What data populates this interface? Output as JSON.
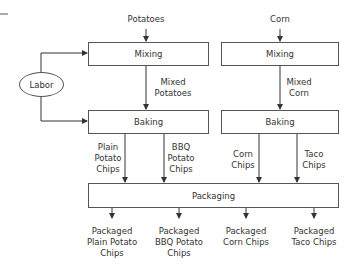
{
  "diagram": {
    "inputs": {
      "potatoes": "Potatoes",
      "corn": "Corn",
      "labor": "Labor"
    },
    "processes": {
      "mixing_left": "Mixing",
      "mixing_right": "Mixing",
      "baking_left": "Baking",
      "baking_right": "Baking",
      "packaging": "Packaging"
    },
    "flows": {
      "mixed_potatoes": "Mixed\nPotatoes",
      "mixed_corn": "Mixed\nCorn",
      "plain_potato_chips": "Plain\nPotato\nChips",
      "bbq_potato_chips": "BBQ\nPotato\nChips",
      "corn_chips": "Corn\nChips",
      "taco_chips": "Taco\nChips"
    },
    "outputs": {
      "packaged_plain": "Packaged\nPlain Potato\nChips",
      "packaged_bbq": "Packaged\nBBQ Potato\nChips",
      "packaged_corn": "Packaged\nCorn Chips",
      "packaged_taco": "Packaged\nTaco Chips"
    }
  }
}
